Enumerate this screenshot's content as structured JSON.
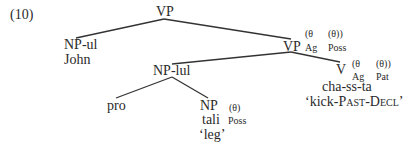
{
  "example_number": "(10)",
  "tree": {
    "root": {
      "label": "VP"
    },
    "subject": {
      "label": "NP-ul",
      "word": "John"
    },
    "vp_inner": {
      "label": "VP",
      "theta_1": "(θ",
      "theta_2": "(θ))",
      "role_1": "Ag",
      "role_2": "Poss"
    },
    "object": {
      "label": "NP-lul"
    },
    "verb": {
      "label": "V",
      "theta_1": "(θ",
      "theta_2": "(θ))",
      "role_1": "Ag",
      "role_2": "Pat",
      "word": "cha-ss-ta",
      "gloss_pre": "‘kick-",
      "gloss_past": "Past",
      "gloss_mid": "-",
      "gloss_decl": "Decl",
      "gloss_post": "’"
    },
    "pro": {
      "label": "pro"
    },
    "possessed": {
      "label": "NP",
      "theta": "(θ)",
      "role": "Poss",
      "word": "tali",
      "gloss": "‘leg’"
    }
  },
  "colors": {
    "text": "#2a2a2a",
    "edge": "#333333",
    "background": "#ffffff"
  }
}
